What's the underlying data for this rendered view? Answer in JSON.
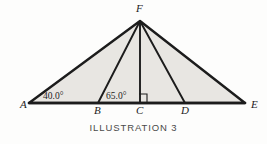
{
  "figure": {
    "caption": "ILLUSTRATION 3",
    "background_color": "#fdfdfc",
    "fill_color": "#e8e6e2",
    "line_color": "#1c1c1c",
    "vertices": [
      {
        "id": "A",
        "label": "A",
        "x": 29,
        "y": 103,
        "label_x": 20,
        "label_y": 108
      },
      {
        "id": "B",
        "label": "B",
        "x": 98,
        "y": 103,
        "label_x": 94,
        "label_y": 114
      },
      {
        "id": "C",
        "label": "C",
        "x": 140,
        "y": 103,
        "label_x": 136,
        "label_y": 114
      },
      {
        "id": "D",
        "label": "D",
        "x": 185,
        "y": 103,
        "label_x": 181,
        "label_y": 114
      },
      {
        "id": "E",
        "label": "E",
        "x": 245,
        "y": 103,
        "label_x": 251,
        "label_y": 108
      },
      {
        "id": "F",
        "label": "F",
        "x": 140,
        "y": 21,
        "label_x": 136,
        "label_y": 12
      }
    ],
    "outline_path": "M 29 103 L 140 21 L 245 103 Z",
    "baseline": {
      "x1": 29,
      "y1": 103,
      "x2": 245,
      "y2": 103
    },
    "cevians": [
      {
        "name": "F-B",
        "x1": 140,
        "y1": 21,
        "x2": 98,
        "y2": 103
      },
      {
        "name": "F-C",
        "x1": 140,
        "y1": 21,
        "x2": 140,
        "y2": 103
      },
      {
        "name": "F-D",
        "x1": 140,
        "y1": 21,
        "x2": 185,
        "y2": 103
      }
    ],
    "right_angle_mark": {
      "x": 139,
      "y": 94,
      "size": 8
    },
    "angles": [
      {
        "id": "angle-A",
        "value": "40.0°",
        "at": "A",
        "label_x": 43,
        "label_y": 99
      },
      {
        "id": "angle-B",
        "value": "65.0°",
        "at": "B",
        "label_x": 106,
        "label_y": 99
      }
    ]
  }
}
